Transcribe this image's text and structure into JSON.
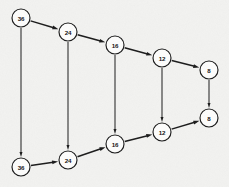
{
  "diagram": {
    "background_color": "#f2f2f0",
    "node_fill": "#fdfdfc",
    "stroke_color": "#1a1a1a",
    "node_radius": 9,
    "nodes": [
      {
        "id": "top-1",
        "label": "36",
        "x": 21,
        "y": 18,
        "row": "top"
      },
      {
        "id": "top-2",
        "label": "24",
        "x": 68,
        "y": 32,
        "row": "top"
      },
      {
        "id": "top-3",
        "label": "16",
        "x": 115,
        "y": 45,
        "row": "top"
      },
      {
        "id": "top-4",
        "label": "12",
        "x": 162,
        "y": 58,
        "row": "top"
      },
      {
        "id": "top-5",
        "label": "8",
        "x": 209,
        "y": 70,
        "row": "top"
      },
      {
        "id": "bot-1",
        "label": "36",
        "x": 21,
        "y": 167,
        "row": "bottom"
      },
      {
        "id": "bot-2",
        "label": "24",
        "x": 68,
        "y": 160,
        "row": "bottom"
      },
      {
        "id": "bot-3",
        "label": "16",
        "x": 115,
        "y": 144,
        "row": "bottom"
      },
      {
        "id": "bot-4",
        "label": "12",
        "x": 162,
        "y": 132,
        "row": "bottom"
      },
      {
        "id": "bot-5",
        "label": "8",
        "x": 209,
        "y": 118,
        "row": "bottom"
      }
    ],
    "edges": [
      {
        "from": "top-1",
        "to": "top-2",
        "kind": "diagonal"
      },
      {
        "from": "top-2",
        "to": "top-3",
        "kind": "diagonal"
      },
      {
        "from": "top-3",
        "to": "top-4",
        "kind": "diagonal"
      },
      {
        "from": "top-4",
        "to": "top-5",
        "kind": "diagonal"
      },
      {
        "from": "top-1",
        "to": "bot-1",
        "kind": "vertical"
      },
      {
        "from": "top-2",
        "to": "bot-2",
        "kind": "vertical"
      },
      {
        "from": "top-3",
        "to": "bot-3",
        "kind": "vertical"
      },
      {
        "from": "top-4",
        "to": "bot-4",
        "kind": "vertical"
      },
      {
        "from": "top-5",
        "to": "bot-5",
        "kind": "vertical"
      },
      {
        "from": "bot-1",
        "to": "bot-2",
        "kind": "diagonal"
      },
      {
        "from": "bot-2",
        "to": "bot-3",
        "kind": "diagonal"
      },
      {
        "from": "bot-3",
        "to": "bot-4",
        "kind": "diagonal"
      },
      {
        "from": "bot-4",
        "to": "bot-5",
        "kind": "diagonal"
      }
    ]
  }
}
